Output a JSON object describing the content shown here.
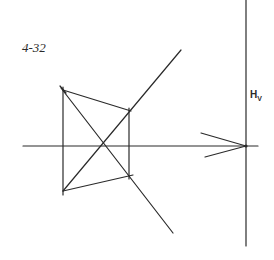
{
  "figure": {
    "label": "4-32",
    "trace_label": "H",
    "trace_subscript": "V",
    "stroke_color": "#2a2a2a",
    "background": "#ffffff"
  },
  "geometry": {
    "vertical_trace": {
      "x": 246,
      "y1": 0,
      "y2": 246
    },
    "horizontal_axis": {
      "y": 146,
      "x1": 23,
      "x2": 258
    },
    "quad": {
      "top_left": [
        63,
        90
      ],
      "top_right": [
        129,
        111
      ],
      "bottom_right": [
        129,
        175
      ],
      "bottom_left": [
        63,
        191
      ]
    },
    "left_edge": {
      "x": 63,
      "y1": 87,
      "y2": 195
    },
    "right_edge": {
      "x": 129,
      "y1": 108,
      "y2": 179
    },
    "diagonal_up": {
      "from": [
        63,
        191
      ],
      "to": [
        181,
        50
      ]
    },
    "diagonal_down": {
      "from": [
        61,
        88
      ],
      "to": [
        173,
        233
      ]
    },
    "arrow_vertex": [
      246,
      146
    ],
    "arrow_upper": [
      201,
      133
    ],
    "arrow_lower": [
      205,
      157
    ]
  }
}
